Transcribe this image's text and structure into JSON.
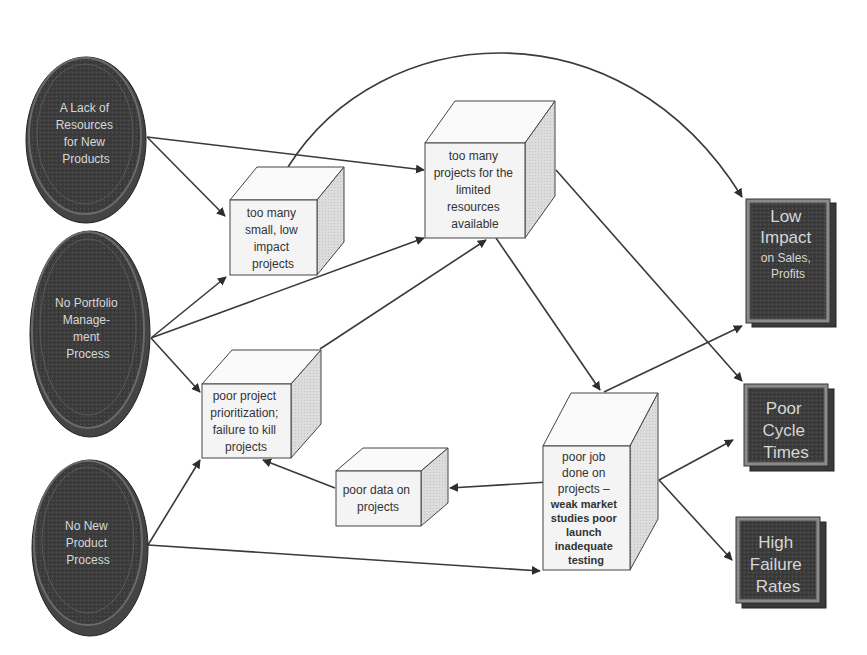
{
  "diagram": {
    "type": "cause-effect flow diagram",
    "root_causes": [
      {
        "id": "lack_resources",
        "lines": [
          "A Lack of",
          "Resources",
          "for New",
          "Products"
        ]
      },
      {
        "id": "no_portfolio",
        "lines": [
          "No Portfolio",
          "Manage-",
          "ment",
          "Process"
        ]
      },
      {
        "id": "no_npp",
        "lines": [
          "No New",
          "Product",
          "Process"
        ]
      }
    ],
    "intermediate_issues": [
      {
        "id": "small_projects",
        "lines": [
          "too many",
          "small, low",
          "impact",
          "projects"
        ]
      },
      {
        "id": "too_many_projects",
        "lines": [
          "too many",
          "projects for the",
          "limited",
          "resources",
          "available"
        ]
      },
      {
        "id": "poor_prioritization",
        "lines": [
          "poor project",
          "prioritization;",
          "failure to kill",
          "projects"
        ]
      },
      {
        "id": "poor_data",
        "lines": [
          "poor data on",
          "projects"
        ]
      },
      {
        "id": "poor_job",
        "lines": [
          "poor job",
          "done on",
          "projects –"
        ],
        "bold_lines": [
          "weak market",
          "studies poor",
          "launch",
          "inadequate",
          "testing"
        ]
      }
    ],
    "outcomes": [
      {
        "id": "low_impact",
        "lines": [
          "Low",
          "Impact"
        ],
        "small_lines": [
          "on Sales,",
          "Profits"
        ]
      },
      {
        "id": "poor_cycle",
        "lines": [
          "Poor",
          "Cycle",
          "Times"
        ]
      },
      {
        "id": "high_failure",
        "lines": [
          "High",
          "Failure",
          "Rates"
        ]
      }
    ],
    "edges": [
      {
        "from": "lack_resources",
        "to": "small_projects"
      },
      {
        "from": "lack_resources",
        "to": "too_many_projects"
      },
      {
        "from": "no_portfolio",
        "to": "small_projects"
      },
      {
        "from": "no_portfolio",
        "to": "too_many_projects"
      },
      {
        "from": "no_portfolio",
        "to": "poor_prioritization"
      },
      {
        "from": "no_npp",
        "to": "poor_prioritization"
      },
      {
        "from": "no_npp",
        "to": "poor_job"
      },
      {
        "from": "small_projects",
        "to": "low_impact"
      },
      {
        "from": "poor_prioritization",
        "to": "too_many_projects"
      },
      {
        "from": "too_many_projects",
        "to": "poor_job"
      },
      {
        "from": "too_many_projects",
        "to": "poor_cycle"
      },
      {
        "from": "poor_job",
        "to": "poor_data"
      },
      {
        "from": "poor_data",
        "to": "poor_prioritization"
      },
      {
        "from": "poor_job",
        "to": "low_impact"
      },
      {
        "from": "poor_job",
        "to": "poor_cycle"
      },
      {
        "from": "poor_job",
        "to": "high_failure"
      }
    ],
    "colors": {
      "ellipse_fill": "#3c3c3c",
      "ellipse_ring": "#6a6a6a",
      "cube_front": "#f4f4f4",
      "cube_side": "#d9d9d9",
      "outcome_fill": "#4a4a4a",
      "outcome_border": "#8a8a8a",
      "arrow": "#3a3a3a"
    }
  }
}
